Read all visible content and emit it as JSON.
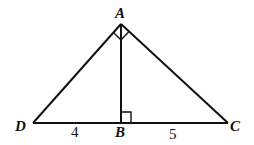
{
  "diagram": {
    "type": "geometry-figure",
    "vertices": {
      "A": {
        "label": "A",
        "x": 121,
        "y": 24
      },
      "D": {
        "label": "D",
        "x": 33,
        "y": 123
      },
      "B": {
        "label": "B",
        "x": 121,
        "y": 123
      },
      "C": {
        "label": "C",
        "x": 228,
        "y": 123
      }
    },
    "segments": [
      "AD",
      "AC",
      "AB",
      "DC"
    ],
    "right_angles": [
      "DAC",
      "ABC"
    ],
    "measurements": {
      "DB": "4",
      "BC": "5"
    },
    "colors": {
      "stroke": "#111111",
      "background": "#ffffff"
    }
  }
}
